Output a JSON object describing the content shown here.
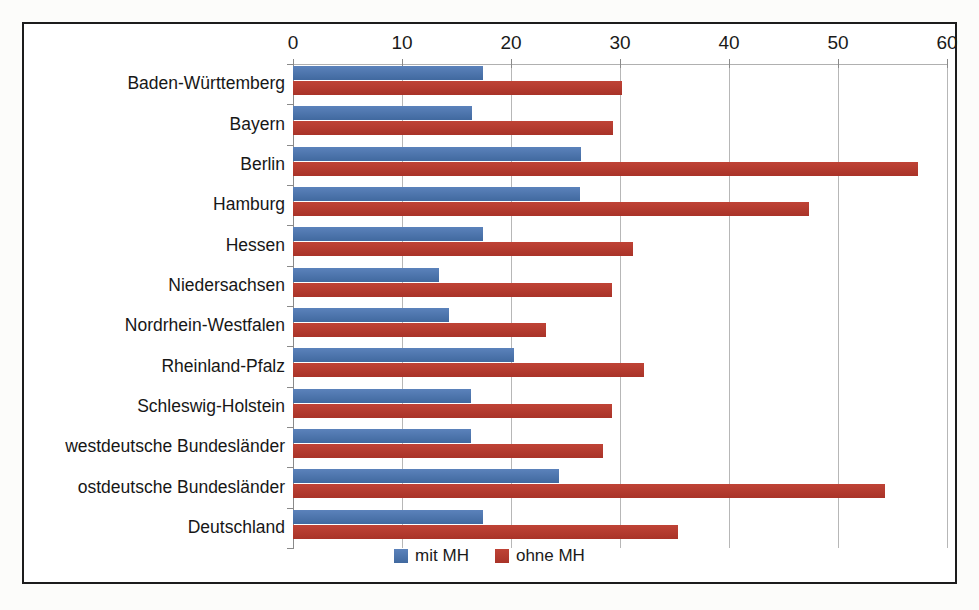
{
  "chart_data": {
    "type": "bar",
    "orientation": "horizontal",
    "title": "",
    "xlabel": "",
    "ylabel": "",
    "xlim": [
      0,
      60
    ],
    "xticks": [
      0,
      10,
      20,
      30,
      40,
      50,
      60
    ],
    "tick_labels": [
      "0",
      "10",
      "20",
      "30",
      "40",
      "50",
      "60"
    ],
    "grid": true,
    "legend_position": "bottom",
    "categories": [
      "Baden-Württemberg",
      "Bayern",
      "Berlin",
      "Hamburg",
      "Hessen",
      "Niedersachsen",
      "Nordrhein-Westfalen",
      "Rheinland-Pfalz",
      "Schleswig-Holstein",
      "westdeutsche Bundesländer",
      "ostdeutsche Bundesländer",
      "Deutschland"
    ],
    "series": [
      {
        "name": "mit MH",
        "color": "#4a72ad",
        "values": [
          17.4,
          16.4,
          26.4,
          26.3,
          17.4,
          13.4,
          14.3,
          20.3,
          16.3,
          16.3,
          24.4,
          17.4
        ]
      },
      {
        "name": "ohne MH",
        "color": "#b5392e",
        "values": [
          30.2,
          29.4,
          57.3,
          47.3,
          31.2,
          29.3,
          23.2,
          32.2,
          29.3,
          28.4,
          54.3,
          35.3
        ]
      }
    ]
  },
  "legend": {
    "items": [
      {
        "label": "mit MH",
        "color": "#4a72ad"
      },
      {
        "label": "ohne MH",
        "color": "#b5392e"
      }
    ]
  }
}
